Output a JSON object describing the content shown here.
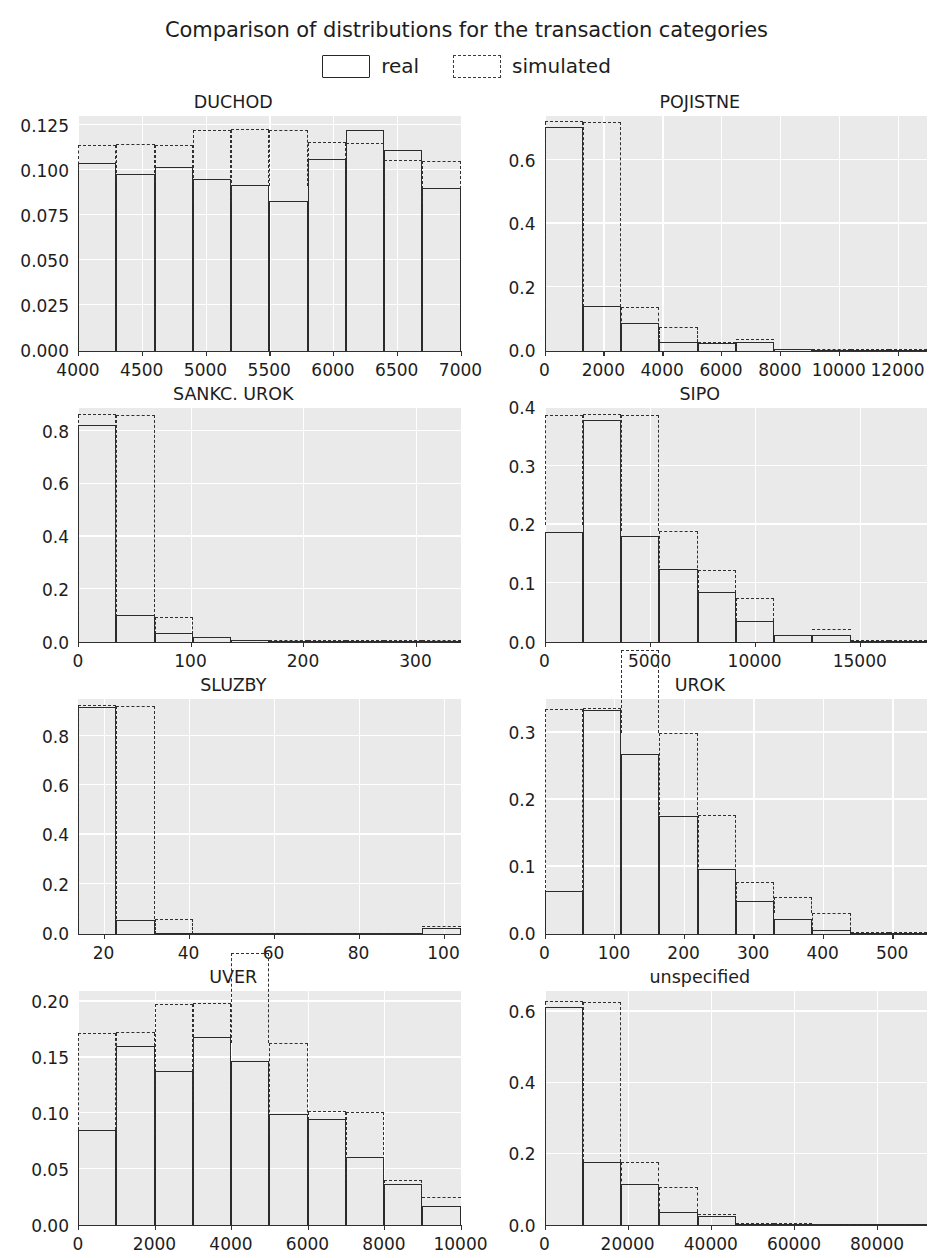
{
  "title": "Comparison of distributions for the transaction categories",
  "legend": [
    {
      "label": "real",
      "style": "solid"
    },
    {
      "label": "simulated",
      "style": "dashed"
    }
  ],
  "colors": {
    "real_line": "#2b2b2b",
    "simulated_line": "#303030",
    "axes_background": "#eaeaea",
    "gridline": "#ffffff",
    "text": "#1d1d1d"
  },
  "chart_data": [
    {
      "type": "bar",
      "title": "DUCHOD",
      "xlabel": "",
      "ylabel": "",
      "xlim": [
        4000,
        7000
      ],
      "ylim": [
        0.0,
        0.13
      ],
      "xticks": [
        4000,
        4500,
        5000,
        5500,
        6000,
        6500,
        7000
      ],
      "xtick_labels": [
        "4000",
        "4500",
        "5000",
        "5500",
        "6000",
        "6500",
        "7000"
      ],
      "yticks": [
        0.0,
        0.025,
        0.05,
        0.075,
        0.1,
        0.125
      ],
      "ytick_labels": [
        "0.000",
        "0.025",
        "0.050",
        "0.075",
        "0.100",
        "0.125"
      ],
      "bin_edges": [
        4000,
        4300,
        4600,
        4900,
        5200,
        5500,
        5800,
        6100,
        6400,
        6700,
        7000
      ],
      "series": [
        {
          "name": "real",
          "values": [
            0.104,
            0.098,
            0.102,
            0.095,
            0.092,
            0.083,
            0.106,
            0.122,
            0.111,
            0.09
          ]
        },
        {
          "name": "simulated",
          "values": [
            0.1,
            0.114,
            0.093,
            0.082,
            0.122,
            0.091,
            0.115,
            0.102,
            0.105,
            0.081
          ]
        }
      ],
      "grid": true,
      "legend_position": "figure-top"
    },
    {
      "type": "bar",
      "title": "POJISTNE",
      "xlabel": "",
      "ylabel": "",
      "xlim": [
        0,
        13000
      ],
      "ylim": [
        0.0,
        0.74
      ],
      "xticks": [
        0,
        2000,
        4000,
        6000,
        8000,
        10000,
        12000
      ],
      "xtick_labels": [
        "0",
        "2000",
        "4000",
        "6000",
        "8000",
        "10000",
        "12000"
      ],
      "yticks": [
        0.0,
        0.2,
        0.4,
        0.6
      ],
      "ytick_labels": [
        "0.0",
        "0.2",
        "0.4",
        "0.6"
      ],
      "bin_edges": [
        0,
        1300,
        2600,
        3900,
        5200,
        6500,
        7800,
        9100,
        10400,
        11700,
        13000
      ],
      "series": [
        {
          "name": "real",
          "values": [
            0.705,
            0.141,
            0.086,
            0.026,
            0.025,
            0.026,
            0.004,
            0.002,
            0.001,
            0.001
          ]
        },
        {
          "name": "simulated",
          "values": [
            0.722,
            0.137,
            0.073,
            0.028,
            0.025,
            0.033,
            0.003,
            0.002,
            0.001,
            0.001
          ]
        }
      ],
      "grid": true,
      "legend_position": "figure-top"
    },
    {
      "type": "bar",
      "title": "SANKC. UROK",
      "xlabel": "",
      "ylabel": "",
      "xlim": [
        0,
        340
      ],
      "ylim": [
        0.0,
        0.89
      ],
      "xticks": [
        0,
        100,
        200,
        300
      ],
      "xtick_labels": [
        "0",
        "100",
        "200",
        "300"
      ],
      "yticks": [
        0.0,
        0.2,
        0.4,
        0.6,
        0.8
      ],
      "ytick_labels": [
        "0.0",
        "0.2",
        "0.4",
        "0.6",
        "0.8"
      ],
      "bin_edges": [
        0,
        34,
        68,
        102,
        136,
        170,
        204,
        238,
        272,
        306,
        340
      ],
      "series": [
        {
          "name": "real",
          "values": [
            0.823,
            0.101,
            0.036,
            0.019,
            0.006,
            0.004,
            0.003,
            0.002,
            0.002,
            0.002
          ]
        },
        {
          "name": "simulated",
          "values": [
            0.86,
            0.095,
            0.03,
            0.017,
            0.005,
            0.004,
            0.003,
            0.002,
            0.002,
            0.002
          ]
        }
      ],
      "grid": true,
      "legend_position": "figure-top"
    },
    {
      "type": "bar",
      "title": "SIPO",
      "xlabel": "",
      "ylabel": "",
      "xlim": [
        0,
        18200
      ],
      "ylim": [
        0.0,
        0.4
      ],
      "xticks": [
        0,
        5000,
        10000,
        15000
      ],
      "xtick_labels": [
        "0",
        "5000",
        "10000",
        "15000"
      ],
      "yticks": [
        0.0,
        0.1,
        0.2,
        0.3,
        0.4
      ],
      "ytick_labels": [
        "0.0",
        "0.1",
        "0.2",
        "0.3",
        "0.4"
      ],
      "bin_edges": [
        0,
        1820,
        3640,
        5460,
        7280,
        9100,
        10920,
        12740,
        14560,
        16380,
        18200
      ],
      "series": [
        {
          "name": "real",
          "values": [
            0.188,
            0.378,
            0.18,
            0.125,
            0.086,
            0.035,
            0.012,
            0.012,
            0.002,
            0.001
          ]
        },
        {
          "name": "simulated",
          "values": [
            0.199,
            0.388,
            0.189,
            0.11,
            0.075,
            0.028,
            0.011,
            0.021,
            0.002,
            0.001
          ]
        }
      ],
      "grid": true,
      "legend_position": "figure-top"
    },
    {
      "type": "bar",
      "title": "SLUZBY",
      "xlabel": "",
      "ylabel": "",
      "xlim": [
        14,
        104
      ],
      "ylim": [
        0.0,
        0.95
      ],
      "xticks": [
        20,
        40,
        60,
        80,
        100
      ],
      "xtick_labels": [
        "20",
        "40",
        "60",
        "80",
        "100"
      ],
      "yticks": [
        0.0,
        0.2,
        0.4,
        0.6,
        0.8
      ],
      "ytick_labels": [
        "0.0",
        "0.2",
        "0.4",
        "0.6",
        "0.8"
      ],
      "bin_edges": [
        14,
        23,
        32,
        41,
        50,
        59,
        68,
        77,
        86,
        95,
        104
      ],
      "series": [
        {
          "name": "real",
          "values": [
            0.919,
            0.053,
            0.0,
            0.0,
            0.0,
            0.0,
            0.0,
            0.0,
            0.0,
            0.023
          ]
        },
        {
          "name": "simulated",
          "values": [
            0.92,
            0.057,
            0.0,
            0.0,
            0.0,
            0.0,
            0.0,
            0.0,
            0.0,
            0.025
          ]
        }
      ],
      "grid": true,
      "legend_position": "figure-top"
    },
    {
      "type": "bar",
      "title": "UROK",
      "xlabel": "",
      "ylabel": "",
      "xlim": [
        0,
        550
      ],
      "ylim": [
        0.0,
        0.35
      ],
      "xticks": [
        0,
        100,
        200,
        300,
        400,
        500
      ],
      "xtick_labels": [
        "0",
        "100",
        "200",
        "300",
        "400",
        "500"
      ],
      "yticks": [
        0.0,
        0.1,
        0.2,
        0.3
      ],
      "ytick_labels": [
        "0.0",
        "0.1",
        "0.2",
        "0.3"
      ],
      "bin_edges": [
        0,
        55,
        110,
        165,
        220,
        275,
        330,
        385,
        440,
        495,
        550
      ],
      "series": [
        {
          "name": "real",
          "values": [
            0.063,
            0.334,
            0.268,
            0.175,
            0.097,
            0.049,
            0.021,
            0.005,
            0.001,
            0.001
          ]
        },
        {
          "name": "simulated",
          "values": [
            0.061,
            0.335,
            0.3,
            0.177,
            0.077,
            0.045,
            0.03,
            0.005,
            0.001,
            0.001
          ]
        }
      ],
      "grid": true,
      "legend_position": "figure-top"
    },
    {
      "type": "bar",
      "title": "UVER",
      "xlabel": "",
      "ylabel": "",
      "xlim": [
        0,
        10000
      ],
      "ylim": [
        0.0,
        0.21
      ],
      "xticks": [
        0,
        2000,
        4000,
        6000,
        8000,
        10000
      ],
      "xtick_labels": [
        "0",
        "2000",
        "4000",
        "6000",
        "8000",
        "10000"
      ],
      "yticks": [
        0.0,
        0.05,
        0.1,
        0.15,
        0.2
      ],
      "ytick_labels": [
        "0.00",
        "0.05",
        "0.10",
        "0.15",
        "0.20"
      ],
      "bin_edges": [
        0,
        1000,
        2000,
        3000,
        4000,
        5000,
        6000,
        7000,
        8000,
        9000,
        10000
      ],
      "series": [
        {
          "name": "real",
          "values": [
            0.085,
            0.16,
            0.138,
            0.168,
            0.147,
            0.099,
            0.095,
            0.061,
            0.037,
            0.017
          ]
        },
        {
          "name": "simulated",
          "values": [
            0.081,
            0.172,
            0.11,
            0.198,
            0.163,
            0.082,
            0.101,
            0.04,
            0.025,
            0.024
          ]
        }
      ],
      "grid": true,
      "legend_position": "figure-top"
    },
    {
      "type": "bar",
      "title": "unspecified",
      "xlabel": "",
      "ylabel": "",
      "xlim": [
        0,
        92000
      ],
      "ylim": [
        0.0,
        0.66
      ],
      "xticks": [
        0,
        20000,
        40000,
        60000,
        80000
      ],
      "xtick_labels": [
        "0",
        "20000",
        "40000",
        "60000",
        "80000"
      ],
      "yticks": [
        0.0,
        0.2,
        0.4,
        0.6
      ],
      "ytick_labels": [
        "0.0",
        "0.2",
        "0.4",
        "0.6"
      ],
      "bin_edges": [
        0,
        9200,
        18400,
        27600,
        36800,
        46000,
        55200,
        64400,
        73600,
        82800,
        92000
      ],
      "series": [
        {
          "name": "real",
          "values": [
            0.613,
            0.178,
            0.115,
            0.038,
            0.024,
            0.003,
            0.002,
            0.001,
            0.001,
            0.001
          ]
        },
        {
          "name": "simulated",
          "values": [
            0.629,
            0.177,
            0.106,
            0.036,
            0.029,
            0.003,
            0.002,
            0.001,
            0.001,
            0.001
          ]
        }
      ],
      "grid": true,
      "legend_position": "figure-top"
    }
  ]
}
